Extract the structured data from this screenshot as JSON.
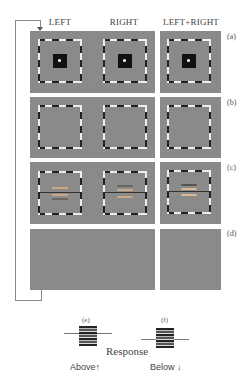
{
  "columns": {
    "left": "LEFT",
    "right": "RIGHT",
    "both": "LEFT+RIGHT"
  },
  "rows": [
    {
      "label": "(a)",
      "content": "fixation-square-in-dashed-frame"
    },
    {
      "label": "(b)",
      "content": "empty-dashed-frame"
    },
    {
      "label": "(c)",
      "content": "gratings-with-reference-line"
    },
    {
      "label": "(d)",
      "content": "blank-gray"
    }
  ],
  "response": {
    "title": "Response",
    "options": [
      {
        "label": "(e)",
        "text": "Above",
        "arrow": "↑"
      },
      {
        "label": "(f)",
        "text": "Below",
        "arrow": "↓"
      }
    ]
  },
  "colors": {
    "panel_gray": "#8a8a8a",
    "frame_dark": "#222222",
    "frame_light": "#eeeeee",
    "loop_line": "#888888"
  }
}
